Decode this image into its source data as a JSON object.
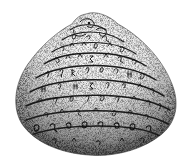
{
  "image": {
    "subject": "Engraved bivalve (clam) shell with inscribed glyphs",
    "style": "stippled black-and-white engraving",
    "background": "#ffffff",
    "ink": "#1a1a1a"
  },
  "shell": {
    "bands": 8,
    "glyph_rows": [
      "ʘ ∽ ∂",
      "∂ ∂ ϱ",
      "ə ∧ ∧ ∽ ʎ",
      "∂ ∧ ∧ ∑ ∧ ϱ",
      "ϒ ϒ ʀ ϒ ∂ ϱ",
      "ʜ ϒ ∑ ϒ ϱ ʜ",
      "ʎ ϒ ϱ ∂ ϒ ∧ ϱ",
      "∂ ϱ ∂ ϱ ϱ ∂ ∂ ϱ"
    ]
  }
}
